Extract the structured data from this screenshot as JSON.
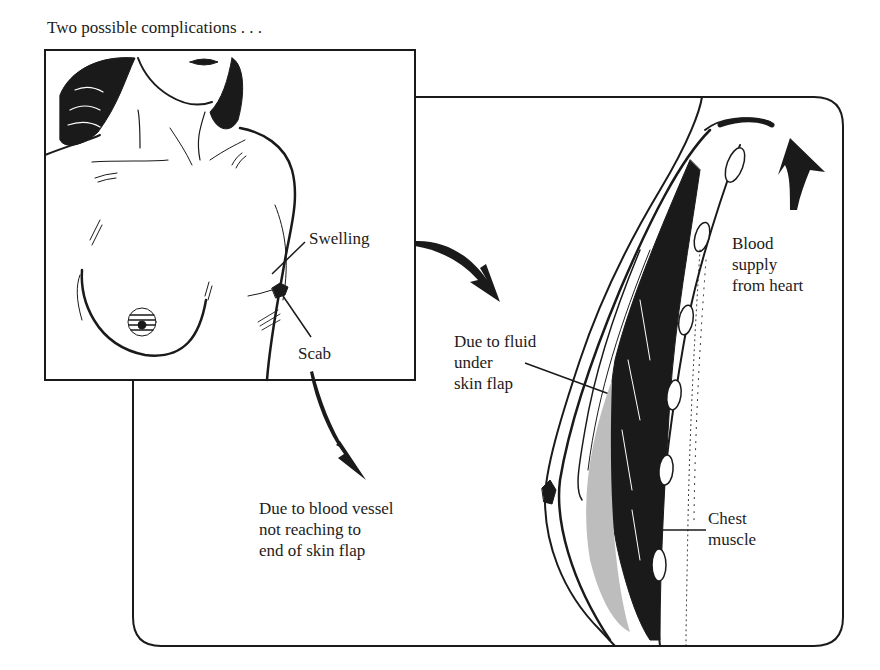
{
  "figure": {
    "caption": "Two possible complications . . .",
    "labels": {
      "swelling": "Swelling",
      "scab": "Scab",
      "fluid": "Due to fluid\nunder\nskin flap",
      "blood_supply": "Blood\nsupply\nfrom heart",
      "vessel": "Due to blood vessel\nnot reaching to\nend of skin flap",
      "chest_muscle": "Chest\nmuscle"
    },
    "panels": [
      {
        "name": "torso-inset",
        "depicts": "front view of female torso after surgery with swelling and scab at skin flap edge"
      },
      {
        "name": "cross-section",
        "depicts": "side cross-section of reconstructed breast showing skin flap, chest muscle and blood supply"
      }
    ],
    "colors": {
      "ink": "#1a1a1a",
      "paper": "#ffffff"
    }
  }
}
